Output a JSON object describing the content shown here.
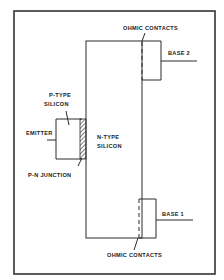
{
  "diagram": {
    "type": "unijunction-transistor-structure",
    "labels": {
      "ohmic_top": "OHMIC CONTACTS",
      "ohmic_bottom": "OHMIC CONTACTS",
      "base2": "BASE 2",
      "base1": "BASE 1",
      "ptype_line1": "P-TYPE",
      "ptype_line2": "SILICON",
      "ntype_line1": "N-TYPE",
      "ntype_line2": "SILICON",
      "emitter": "EMITTER",
      "pn_junction": "P-N JUNCTION"
    },
    "colors": {
      "line": "#2a2a2a",
      "background": "#ffffff"
    }
  }
}
